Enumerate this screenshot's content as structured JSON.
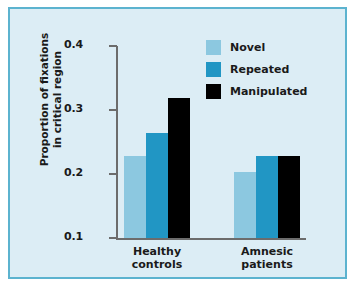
{
  "figure": {
    "background_color": "#dcedf5",
    "border_color": "#5cb3cf",
    "page_background": "#ffffff"
  },
  "chart_data": {
    "type": "bar",
    "title": "",
    "subtitle": "",
    "xlabel": "",
    "ylabel": "Proportion of fixations\nin critical region",
    "categories": [
      "Healthy\ncontrols",
      "Amnesic\npatients"
    ],
    "series": [
      {
        "name": "Novel",
        "color": "#8cc8e0",
        "values": [
          0.228,
          0.203
        ]
      },
      {
        "name": "Repeated",
        "color": "#2196c4",
        "values": [
          0.264,
          0.228
        ]
      },
      {
        "name": "Manipulated",
        "color": "#000000",
        "values": [
          0.318,
          0.228
        ]
      }
    ],
    "ylim": [
      0.1,
      0.4
    ],
    "yticks": [
      0.1,
      0.2,
      0.3,
      0.4
    ],
    "ytick_labels": [
      "0.1",
      "0.2",
      "0.3",
      "0.4"
    ],
    "grid": false,
    "legend_position": "top-right",
    "legend_entries": [
      "Novel",
      "Repeated",
      "Manipulated"
    ]
  }
}
